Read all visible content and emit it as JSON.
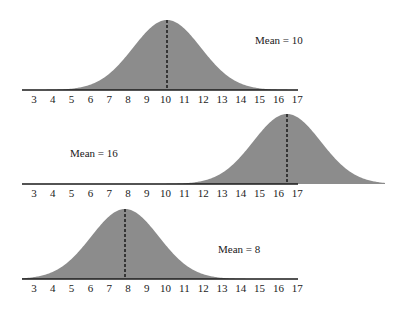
{
  "colors": {
    "fill": "#8c8c8c",
    "axis": "#1a1a1a",
    "mean_line": "#111111",
    "background": "#ffffff"
  },
  "chart_data": [
    {
      "type": "area",
      "title": "",
      "xlabel": "",
      "ylabel": "",
      "distribution": "normal",
      "mean": 10,
      "sd": 1.8,
      "annotation": "Mean = 10",
      "x_ticks": [
        3,
        4,
        5,
        6,
        7,
        8,
        9,
        10,
        11,
        12,
        13,
        14,
        15,
        16,
        17
      ],
      "xlim": [
        2.4,
        17.1
      ],
      "grid": false,
      "mean_line": "dashed vertical at mean"
    },
    {
      "type": "area",
      "title": "",
      "xlabel": "",
      "ylabel": "",
      "distribution": "normal",
      "mean": 16,
      "drawn_peak": 16.5,
      "sd": 1.8,
      "annotation": "Mean = 16",
      "x_ticks": [
        3,
        4,
        5,
        6,
        7,
        8,
        9,
        10,
        11,
        12,
        13,
        14,
        15,
        16,
        17
      ],
      "xlim": [
        2.4,
        17.1
      ],
      "grid": false,
      "mean_line": "dashed vertical at mean"
    },
    {
      "type": "area",
      "title": "",
      "xlabel": "",
      "ylabel": "",
      "distribution": "normal",
      "mean": 8,
      "drawn_peak": 7.85,
      "sd": 1.8,
      "annotation": "Mean = 8",
      "x_ticks": [
        3,
        4,
        5,
        6,
        7,
        8,
        9,
        10,
        11,
        12,
        13,
        14,
        15,
        16,
        17
      ],
      "xlim": [
        2.4,
        17.1
      ],
      "grid": false,
      "mean_line": "dashed vertical at mean"
    }
  ],
  "panels": [
    {
      "annotation": "Mean = 10",
      "ann_x": 255,
      "ann_y": 44,
      "baseline_y": 90,
      "peak_y": 20,
      "peak_px": 167,
      "axis_end_px": 298,
      "curve_end_px": 298
    },
    {
      "annotation": "Mean = 16",
      "ann_x": 70,
      "ann_y": 157,
      "baseline_y": 184,
      "peak_y": 114,
      "peak_px": 287,
      "axis_end_px": 298,
      "curve_end_px": 385
    },
    {
      "annotation": "Mean = 8",
      "ann_x": 218,
      "ann_y": 253,
      "baseline_y": 279,
      "peak_y": 209,
      "peak_px": 125,
      "axis_end_px": 298,
      "curve_end_px": 298
    }
  ],
  "layout": {
    "axis_start_px": 22,
    "tick3_px": 34,
    "px_per_unit": 18.8,
    "tick_label_offset": 13
  }
}
